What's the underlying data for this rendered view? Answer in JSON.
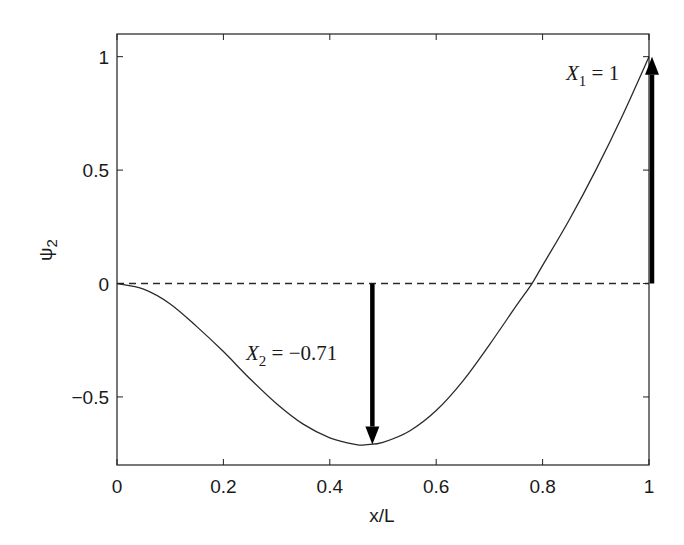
{
  "chart_data": {
    "type": "line",
    "title": "",
    "xlabel": "x/L",
    "ylabel": "ψ2",
    "xlim": [
      0,
      1
    ],
    "ylim": [
      -0.8,
      1.1
    ],
    "grid": false,
    "legend": null,
    "xticks": [
      0,
      0.2,
      0.4,
      0.6,
      0.8,
      1
    ],
    "xtick_labels": [
      "0",
      "0.2",
      "0.4",
      "0.6",
      "0.8",
      "1"
    ],
    "yticks": [
      -0.5,
      0,
      0.5,
      1
    ],
    "ytick_labels": [
      "−0.5",
      "0",
      "0.5",
      "1"
    ],
    "series": [
      {
        "name": "second mode shape ψ2",
        "style": "solid",
        "x": [
          0,
          0.05,
          0.1,
          0.15,
          0.2,
          0.25,
          0.3,
          0.35,
          0.4,
          0.45,
          0.47,
          0.5,
          0.55,
          0.6,
          0.65,
          0.7,
          0.75,
          0.78,
          0.8,
          0.85,
          0.9,
          0.95,
          1.0
        ],
        "values": [
          0,
          -0.025,
          -0.09,
          -0.19,
          -0.3,
          -0.42,
          -0.53,
          -0.62,
          -0.68,
          -0.71,
          -0.71,
          -0.7,
          -0.65,
          -0.56,
          -0.43,
          -0.27,
          -0.1,
          0,
          0.08,
          0.28,
          0.5,
          0.74,
          1.0
        ]
      },
      {
        "name": "zero reference",
        "style": "dashed",
        "x": [
          0,
          1
        ],
        "values": [
          0,
          0
        ]
      }
    ],
    "annotations": [
      {
        "type": "arrow",
        "x": 0.48,
        "from": 0,
        "to": -0.71,
        "label_var": "X",
        "label_sub": "2",
        "label_rest": " = −0.71",
        "label": "X2 = −0.71"
      },
      {
        "type": "arrow",
        "x": 1.0,
        "from": 0,
        "to": 1.0,
        "label_var": "X",
        "label_sub": "1",
        "label_rest": " = 1",
        "label": "X1 = 1"
      }
    ]
  },
  "colors": {
    "line": "#2a2a2a",
    "axis": "#1f1f1f",
    "arrow": "#000000"
  }
}
